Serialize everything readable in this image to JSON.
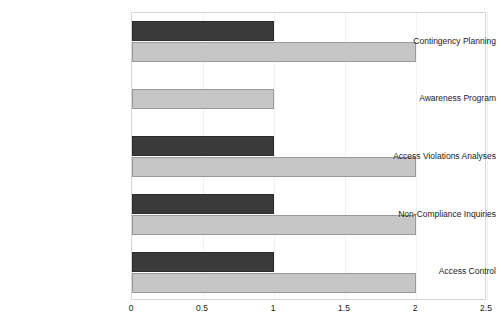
{
  "chart_data": {
    "type": "bar",
    "orientation": "horizontal",
    "title": "",
    "xlabel": "",
    "ylabel": "",
    "xlim": [
      0,
      2.5
    ],
    "xticks": [
      "0",
      "0.5",
      "1",
      "1.5",
      "2",
      "2.5"
    ],
    "xtick_values": [
      0,
      0.5,
      1,
      1.5,
      2,
      2.5
    ],
    "grid": true,
    "legend": "none",
    "categories": [
      "Contingency Planning",
      "Awareness Program",
      "Access Violations Analyses",
      "Non-Compliance Inquiries",
      "Access Control"
    ],
    "series": [
      {
        "name": "series-dark",
        "color": "#3a3a3a",
        "values": [
          1,
          0,
          1,
          1,
          1
        ]
      },
      {
        "name": "series-light",
        "color": "#c6c6c6",
        "values": [
          2,
          1,
          2,
          2,
          2
        ]
      }
    ]
  },
  "colors": {
    "dark_bar": "#3a3a3a",
    "dark_bar_edge": "#2b2b2b",
    "light_bar": "#c6c6c6",
    "light_bar_edge": "#9a9a9a",
    "plot_border": "#d6d6d6",
    "gridline": "#f0f0f0",
    "text": "#1a1a1a",
    "background": "#ffffff"
  }
}
